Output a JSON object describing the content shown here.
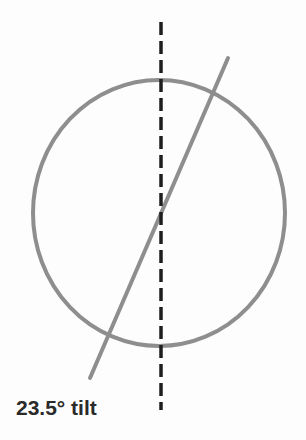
{
  "diagram": {
    "label": "23.5° tilt",
    "colors": {
      "circle": "#8e8e8e",
      "axis": "#8e8e8e",
      "vertical": "#1e1e1e",
      "text": "#2a2a2a"
    },
    "circle": {
      "cx": 159,
      "cy": 213,
      "rx": 126,
      "ry": 133
    },
    "tilted_axis": {
      "x1": 90,
      "y1": 378,
      "x2": 228,
      "y2": 58,
      "angle_deg": 23.5
    },
    "vertical_reference": {
      "x": 161,
      "y1": 22,
      "y2": 410,
      "style": "dashed"
    }
  }
}
